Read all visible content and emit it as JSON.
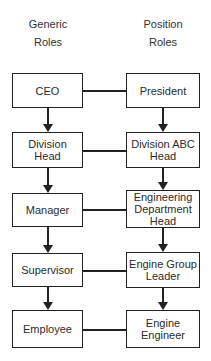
{
  "diagram": {
    "headers": [
      {
        "line1": "Generic",
        "line2": "Roles"
      },
      {
        "line1": "Position",
        "line2": "Roles"
      }
    ],
    "nodes": {
      "generic": [
        "CEO",
        "Division Head",
        "Manager",
        "Supervisor",
        "Employee"
      ],
      "position": [
        "President",
        "Division ABC Head",
        "Engineering Department Head",
        "Engine Group Leader",
        "Engine Engineer"
      ]
    },
    "edges": {
      "peer_links": [
        [
          "CEO",
          "President"
        ],
        [
          "Division Head",
          "Division ABC Head"
        ],
        [
          "Manager",
          "Engineering Department Head"
        ],
        [
          "Supervisor",
          "Engine Group Leader"
        ],
        [
          "Employee",
          "Engine Engineer"
        ]
      ],
      "generic_chain": [
        "CEO > Division Head",
        "Division Head > Manager",
        "Manager > Supervisor",
        "Supervisor > Employee"
      ],
      "position_chain": [
        "President > Division ABC Head",
        "Division ABC Head > Engineering Department Head",
        "Engineering Department Head > Engine Group Leader",
        "Engine Group Leader > Engine Engineer"
      ]
    },
    "colors": {
      "background": "#ffffff",
      "line": "#222222",
      "text": "#2b2b2b"
    }
  }
}
